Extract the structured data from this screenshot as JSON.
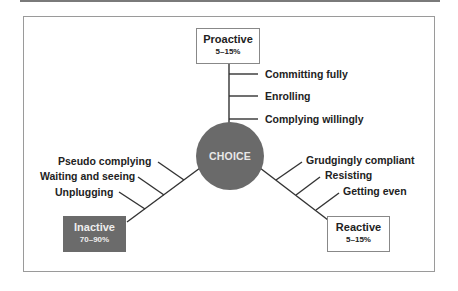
{
  "diagram": {
    "center": {
      "label": "CHOICE"
    },
    "branches": {
      "proactive": {
        "title": "Proactive",
        "percent": "5–15%",
        "items": [
          "Committing fully",
          "Enrolling",
          "Complying willingly"
        ]
      },
      "inactive": {
        "title": "Inactive",
        "percent": "70–90%",
        "items": [
          "Pseudo complying",
          "Waiting and seeing",
          "Unplugging"
        ]
      },
      "reactive": {
        "title": "Reactive",
        "percent": "5–15%",
        "items": [
          "Grudgingly compliant",
          "Resisting",
          "Getting even"
        ]
      }
    }
  },
  "colors": {
    "circle": "#6a6a6a",
    "inactive_box": "#6b6b6b",
    "line": "#333333",
    "frame": "#9a9a9a"
  }
}
